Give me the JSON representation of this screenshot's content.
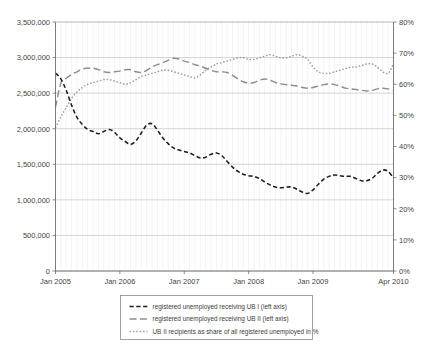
{
  "chart_data": {
    "type": "line",
    "title": "",
    "xlabel": "",
    "ylabel": "",
    "grid": true,
    "legend_position": "bottom",
    "x_tick_labels": [
      "Jan 2005",
      "Jan 2006",
      "Jan 2007",
      "Jan 2008",
      "Jan 2009",
      "Apr 2010"
    ],
    "x_tick_index": [
      0,
      12,
      24,
      36,
      48,
      63
    ],
    "x": [
      "Jan 2005",
      "Feb 2005",
      "Mar 2005",
      "Apr 2005",
      "May 2005",
      "Jun 2005",
      "Jul 2005",
      "Aug 2005",
      "Sep 2005",
      "Oct 2005",
      "Nov 2005",
      "Dec 2005",
      "Jan 2006",
      "Feb 2006",
      "Mar 2006",
      "Apr 2006",
      "May 2006",
      "Jun 2006",
      "Jul 2006",
      "Aug 2006",
      "Sep 2006",
      "Oct 2006",
      "Nov 2006",
      "Dec 2006",
      "Jan 2007",
      "Feb 2007",
      "Mar 2007",
      "Apr 2007",
      "May 2007",
      "Jun 2007",
      "Jul 2007",
      "Aug 2007",
      "Sep 2007",
      "Oct 2007",
      "Nov 2007",
      "Dec 2007",
      "Jan 2008",
      "Feb 2008",
      "Mar 2008",
      "Apr 2008",
      "May 2008",
      "Jun 2008",
      "Jul 2008",
      "Aug 2008",
      "Sep 2008",
      "Oct 2008",
      "Nov 2008",
      "Dec 2008",
      "Jan 2009",
      "Feb 2009",
      "Mar 2009",
      "Apr 2009",
      "May 2009",
      "Jun 2009",
      "Jul 2009",
      "Aug 2009",
      "Sep 2009",
      "Oct 2009",
      "Nov 2009",
      "Dec 2009",
      "Jan 2010",
      "Feb 2010",
      "Mar 2010",
      "Apr 2010"
    ],
    "left_axis": {
      "label": "",
      "ylim": [
        0,
        3500000
      ],
      "ticks": [
        0,
        500000,
        1000000,
        1500000,
        2000000,
        2500000,
        3000000,
        3500000
      ],
      "tick_labels": [
        "0",
        "500,000",
        "1,000,000",
        "1,500,000",
        "2,000,000",
        "2,500,000",
        "3,000,000",
        "3,500,000"
      ]
    },
    "right_axis": {
      "label": "",
      "ylim": [
        0,
        80
      ],
      "ticks": [
        0,
        10,
        20,
        30,
        40,
        50,
        60,
        70,
        80
      ],
      "tick_labels": [
        "0%",
        "10%",
        "20%",
        "30%",
        "40%",
        "50%",
        "60%",
        "70%",
        "80%"
      ]
    },
    "series": [
      {
        "name": "registered unemployed receiving UB I (left axis)",
        "axis": "left",
        "style": "short-dash",
        "color": "#1d1d1d",
        "values": [
          2780000,
          2700000,
          2540000,
          2330000,
          2160000,
          2060000,
          1990000,
          1960000,
          1930000,
          1960000,
          1990000,
          1950000,
          1870000,
          1820000,
          1780000,
          1830000,
          1940000,
          2050000,
          2070000,
          1980000,
          1870000,
          1790000,
          1730000,
          1700000,
          1680000,
          1660000,
          1620000,
          1590000,
          1600000,
          1640000,
          1660000,
          1620000,
          1540000,
          1460000,
          1400000,
          1360000,
          1340000,
          1330000,
          1300000,
          1250000,
          1210000,
          1180000,
          1170000,
          1180000,
          1180000,
          1150000,
          1110000,
          1090000,
          1140000,
          1220000,
          1290000,
          1330000,
          1350000,
          1340000,
          1330000,
          1330000,
          1300000,
          1270000,
          1270000,
          1300000,
          1370000,
          1420000,
          1400000,
          1310000
        ]
      },
      {
        "name": "registered unemployed receiving UB II (left axis)",
        "axis": "left",
        "style": "long-dash",
        "color": "#8d8d8d",
        "values": [
          2300000,
          2640000,
          2710000,
          2760000,
          2800000,
          2840000,
          2850000,
          2850000,
          2830000,
          2800000,
          2790000,
          2800000,
          2810000,
          2830000,
          2830000,
          2800000,
          2790000,
          2820000,
          2870000,
          2900000,
          2930000,
          2960000,
          2990000,
          2980000,
          2950000,
          2930000,
          2900000,
          2880000,
          2850000,
          2820000,
          2800000,
          2800000,
          2790000,
          2750000,
          2700000,
          2660000,
          2640000,
          2650000,
          2680000,
          2700000,
          2680000,
          2650000,
          2630000,
          2620000,
          2610000,
          2600000,
          2580000,
          2570000,
          2580000,
          2600000,
          2620000,
          2630000,
          2620000,
          2600000,
          2570000,
          2560000,
          2550000,
          2540000,
          2530000,
          2540000,
          2560000,
          2570000,
          2560000,
          2540000
        ]
      },
      {
        "name": "UB II recipients as share of all registered unemployed in %",
        "axis": "right",
        "style": "dotted",
        "color": "#9a9a9a",
        "values": [
          46.0,
          49.5,
          52.5,
          55.5,
          57.5,
          59.0,
          60.0,
          60.5,
          61.0,
          61.5,
          61.5,
          61.0,
          60.5,
          60.0,
          60.5,
          61.5,
          62.5,
          63.0,
          63.5,
          64.0,
          64.5,
          64.5,
          64.0,
          63.5,
          63.0,
          62.5,
          62.0,
          63.0,
          64.5,
          65.5,
          66.5,
          67.0,
          67.5,
          68.0,
          68.5,
          68.5,
          68.0,
          68.0,
          68.5,
          69.0,
          69.5,
          69.0,
          68.5,
          68.5,
          69.0,
          69.5,
          69.0,
          68.0,
          65.5,
          64.0,
          63.5,
          63.5,
          64.0,
          64.5,
          65.0,
          65.5,
          65.5,
          66.0,
          66.5,
          66.5,
          65.5,
          64.0,
          63.5,
          66.5
        ]
      }
    ]
  },
  "legend": {
    "entries": [
      {
        "label": "registered unemployed receiving UB I (left axis)",
        "style": "short-dash"
      },
      {
        "label": "registered unemployed receiving UB II (left axis)",
        "style": "long-dash"
      },
      {
        "label": "UB II recipients as share of all registered unemployed in %",
        "style": "dotted"
      }
    ]
  }
}
